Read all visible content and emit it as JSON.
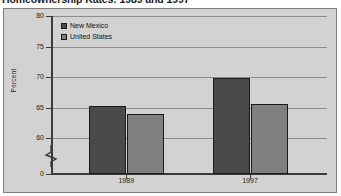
{
  "title": "Homeownership Rates: 1989 and 1997",
  "colors": {
    "new_mexico": "#4a4a4a",
    "united_states": "#808080",
    "plot_background": "#d2d2d2",
    "frame_border": "#7d7d7d",
    "axis": "#3a3a3a",
    "gridline": "#8d8d8d"
  },
  "legend": {
    "position": "top-left-inside",
    "items": [
      {
        "label": "New Mexico",
        "color": "#4a4a4a"
      },
      {
        "label": "United States",
        "color": "#808080"
      }
    ]
  },
  "axes": {
    "y_title": "Percent",
    "y_ticks": [
      "80",
      "75",
      "70",
      "65",
      "60",
      "0"
    ],
    "y_break": true,
    "x_ticks": [
      "1989",
      "1997"
    ]
  },
  "chart_data": {
    "type": "bar",
    "title": "Homeownership Rates: 1989 and 1997",
    "xlabel": "",
    "ylabel": "Percent",
    "categories": [
      "1989",
      "1997"
    ],
    "series": [
      {
        "name": "New Mexico",
        "values": [
          65.3,
          69.8
        ],
        "color": "#4a4a4a"
      },
      {
        "name": "United States",
        "values": [
          63.9,
          65.6
        ],
        "color": "#808080"
      }
    ],
    "ylim": [
      60,
      80
    ],
    "y_axis_break_below": 60,
    "y_tick_values": [
      80,
      75,
      70,
      65,
      60,
      0
    ],
    "grid": true,
    "legend_position": "upper left"
  }
}
